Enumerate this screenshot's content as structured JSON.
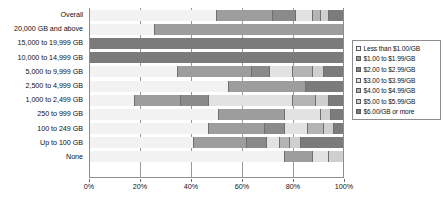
{
  "chart_data": {
    "type": "bar",
    "orientation": "horizontal",
    "stacked": true,
    "normalized": "100%",
    "title": "",
    "xlabel": "",
    "ylabel": "",
    "xlim": [
      0,
      100
    ],
    "xticks": [
      "0%",
      "20%",
      "40%",
      "60%",
      "80%",
      "100%"
    ],
    "xtick_values": [
      0,
      20,
      40,
      60,
      80,
      100
    ],
    "grid": true,
    "legend_position": "right",
    "categories": [
      "Overall",
      "20,000 GB and above",
      "15,000 to 19,999 GB",
      "10,000 to 14,999 GB",
      "5,000 to 9,999 GB",
      "2,500 to 4,999 GB",
      "1,000 to 2,499 GB",
      "250 to 999 GB",
      "100 to 249 GB",
      "Up to 100 GB",
      "None"
    ],
    "series": [
      {
        "name": "Less than $1.00/GB",
        "swatch": "#f2f2f2",
        "values": [
          50,
          26,
          0,
          0,
          35,
          55,
          18,
          51,
          47,
          41,
          77
        ]
      },
      {
        "name": "$1.00 to $1.99/GB",
        "swatch": "#9d9d9d",
        "values": [
          22,
          74,
          0,
          0,
          29,
          30,
          18,
          26,
          22,
          21,
          11
        ]
      },
      {
        "name": "$2.00 to $2.99/GB",
        "swatch": "#8a8a8a",
        "values": [
          9,
          0,
          0,
          0,
          7,
          0,
          11,
          0,
          8,
          8,
          0
        ]
      },
      {
        "name": "$3.00 to $3.99/GB",
        "swatch": "#e2e2e2",
        "values": [
          7,
          0,
          0,
          0,
          9,
          0,
          33,
          14,
          9,
          5,
          6
        ]
      },
      {
        "name": "$4.00 to $4.99/GB",
        "swatch": "#b4b4b4",
        "values": [
          3,
          0,
          0,
          0,
          8,
          0,
          9,
          0,
          6,
          4,
          0
        ]
      },
      {
        "name": "$5.00 to $5.99/GB",
        "swatch": "#cfcfcf",
        "values": [
          3,
          0,
          0,
          0,
          4,
          0,
          5,
          4,
          4,
          4,
          6
        ]
      },
      {
        "name": "$6.00/GB or more",
        "swatch": "#7b7b7b",
        "values": [
          6,
          0,
          100,
          100,
          8,
          15,
          6,
          5,
          4,
          17,
          0
        ]
      }
    ]
  },
  "legend": {
    "items": [
      "Less than $1.00/GB",
      "$1.00 to $1.99/GB",
      "$2.00 to $2.99/GB",
      "$3.00 to $3.99/GB",
      "$4.00 to $4.99/GB",
      "$5.00 to $5.99/GB",
      "$6.00/GB or more"
    ]
  }
}
